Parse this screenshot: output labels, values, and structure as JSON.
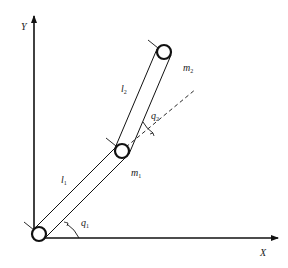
{
  "diagram": {
    "axes": {
      "x_label": "X",
      "y_label": "Y"
    },
    "links": [
      {
        "name": "l",
        "sub": "1"
      },
      {
        "name": "l",
        "sub": "2"
      }
    ],
    "masses": [
      {
        "name": "m",
        "sub": "1"
      },
      {
        "name": "m",
        "sub": "2"
      }
    ],
    "angles": [
      {
        "name": "q",
        "sub": "1"
      },
      {
        "name": "q",
        "sub": "2"
      }
    ],
    "colors": {
      "stroke": "#111111",
      "background": "#ffffff"
    }
  }
}
